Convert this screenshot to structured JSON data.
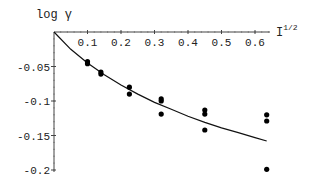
{
  "chart_data": {
    "type": "scatter",
    "title": "",
    "xlabel": "I^1/2",
    "ylabel": "log γ",
    "xlabel_parts": {
      "base": "I",
      "sup": "1/2"
    },
    "ylabel_parts": {
      "text": "log γ"
    },
    "xlim": [
      0,
      0.65
    ],
    "ylim": [
      -0.2,
      0
    ],
    "x_ticks": [
      0.1,
      0.2,
      0.3,
      0.4,
      0.5,
      0.6
    ],
    "x_tick_labels": [
      "0.1",
      "0.2",
      "0.3",
      "0.4",
      "0.5",
      "0.6"
    ],
    "y_ticks": [
      -0.05,
      -0.1,
      -0.15,
      -0.2
    ],
    "y_tick_labels": [
      "-0.05",
      "-0.1",
      "-0.15",
      "-0.2"
    ],
    "grid": false,
    "legend": null,
    "series": [
      {
        "name": "measured",
        "kind": "points",
        "points": [
          [
            0.1,
            -0.043
          ],
          [
            0.1,
            -0.046
          ],
          [
            0.14,
            -0.058
          ],
          [
            0.14,
            -0.061
          ],
          [
            0.225,
            -0.08
          ],
          [
            0.225,
            -0.09
          ],
          [
            0.32,
            -0.097
          ],
          [
            0.32,
            -0.1
          ],
          [
            0.32,
            -0.119
          ],
          [
            0.45,
            -0.113
          ],
          [
            0.45,
            -0.119
          ],
          [
            0.45,
            -0.142
          ],
          [
            0.635,
            -0.12
          ],
          [
            0.635,
            -0.129
          ],
          [
            0.635,
            -0.199
          ]
        ]
      },
      {
        "name": "fit",
        "kind": "line",
        "points": [
          [
            0.0,
            0.0
          ],
          [
            0.05,
            -0.025
          ],
          [
            0.1,
            -0.045
          ],
          [
            0.15,
            -0.062
          ],
          [
            0.2,
            -0.077
          ],
          [
            0.25,
            -0.09
          ],
          [
            0.3,
            -0.102
          ],
          [
            0.35,
            -0.112
          ],
          [
            0.4,
            -0.122
          ],
          [
            0.45,
            -0.131
          ],
          [
            0.5,
            -0.139
          ],
          [
            0.55,
            -0.146
          ],
          [
            0.6,
            -0.153
          ],
          [
            0.635,
            -0.158
          ]
        ]
      }
    ]
  }
}
